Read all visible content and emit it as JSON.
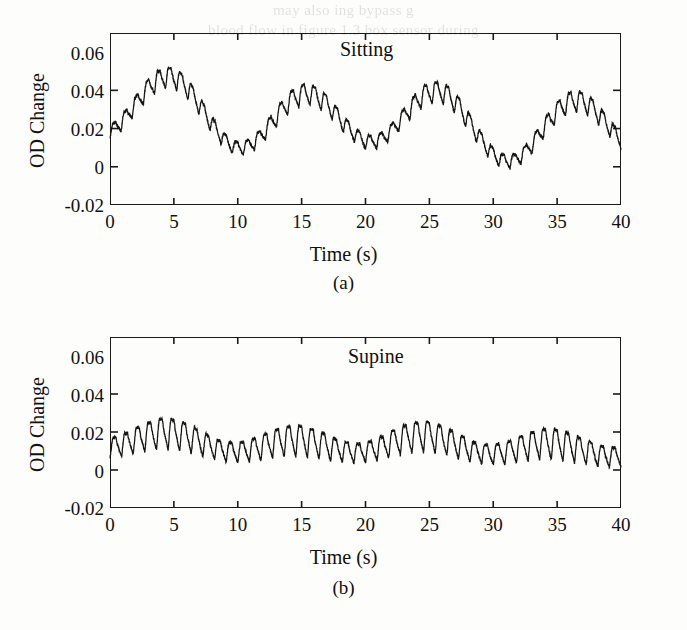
{
  "page": {
    "background_color": "#fdfdfc",
    "ink_color": "#141414",
    "bleedthrough": {
      "line1": "may also ing bypass g",
      "line2": "blood flow in figure 1.3 box sensor during",
      "line3": "use of relating the oximeter the in appl"
    }
  },
  "figure": {
    "panels": [
      {
        "id": "a",
        "caption": "(a)",
        "annotation": "Sitting",
        "chart_data": {
          "type": "line",
          "title": "Sitting",
          "xlabel": "Time (s)",
          "ylabel": "OD Change",
          "xlim": [
            0,
            40
          ],
          "ylim": [
            -0.02,
            0.07
          ],
          "xticks": [
            0,
            5,
            10,
            15,
            20,
            25,
            30,
            35,
            40
          ],
          "xticklabels": [
            "0",
            "5",
            "10",
            "15",
            "20",
            "25",
            "30",
            "35",
            "40"
          ],
          "yticks": [
            -0.02,
            0,
            0.02,
            0.04,
            0.06
          ],
          "yticklabels": [
            "-0.02",
            "0",
            "0.02",
            "0.04",
            "0.06"
          ],
          "grid": false,
          "legend": "none",
          "series": [
            {
              "name": "OD Change (sitting)",
              "description": "Cardiac pulse oscillation near 1.15 Hz riding on a large respiratory/Mayer-wave baseline modulation near 0.095 Hz",
              "pulse_frequency_hz": 1.15,
              "pulse_amplitude": 0.009,
              "baseline_mean": 0.029,
              "baseline_modulation_amplitude": 0.0145,
              "baseline_modulation_frequency_hz": 0.095,
              "baseline_secondary_amplitude": 0.004,
              "baseline_secondary_frequency_hz": 0.052,
              "trend_slope_per_second": -0.00028,
              "envelope_peaks_time_s": [
                2.5,
                13.0,
                22.0,
                31.0
              ],
              "envelope_peaks_value": [
                0.066,
                0.065,
                0.055,
                0.057
              ],
              "envelope_troughs_time_s": [
                8.5,
                18.0,
                27.0,
                37.5
              ],
              "envelope_troughs_value": [
                0.003,
                0.006,
                0.01,
                -0.012
              ],
              "y_min_observed": -0.015,
              "y_max_observed": 0.067
            }
          ]
        }
      },
      {
        "id": "b",
        "caption": "(b)",
        "annotation": "Supine",
        "chart_data": {
          "type": "line",
          "title": "Supine",
          "xlabel": "Time (s)",
          "ylabel": "OD Change",
          "xlim": [
            0,
            40
          ],
          "ylim": [
            -0.02,
            0.07
          ],
          "xticks": [
            0,
            5,
            10,
            15,
            20,
            25,
            30,
            35,
            40
          ],
          "xticklabels": [
            "0",
            "5",
            "10",
            "15",
            "20",
            "25",
            "30",
            "35",
            "40"
          ],
          "yticks": [
            -0.02,
            0,
            0.02,
            0.04,
            0.06
          ],
          "yticklabels": [
            "-0.02",
            "0",
            "0.02",
            "0.04",
            "0.06"
          ],
          "grid": false,
          "legend": "none",
          "series": [
            {
              "name": "OD Change (supine)",
              "description": "Cardiac pulse oscillation near 1.1 Hz with only weak baseline modulation; far smaller respiratory sway than sitting",
              "pulse_frequency_hz": 1.1,
              "pulse_amplitude": 0.0135,
              "baseline_mean": 0.013,
              "baseline_modulation_amplitude": 0.0035,
              "baseline_modulation_frequency_hz": 0.1,
              "baseline_secondary_amplitude": 0.0015,
              "baseline_secondary_frequency_hz": 0.047,
              "trend_slope_per_second": -8e-05,
              "envelope_peaks_time_s": [
                9.5,
                20.5,
                31.0,
                39.5
              ],
              "envelope_peaks_value": [
                0.035,
                0.033,
                0.027,
                0.024
              ],
              "envelope_troughs_time_s": [
                5.0,
                15.0,
                26.0,
                34.0
              ],
              "envelope_troughs_value": [
                -0.004,
                -0.004,
                -0.006,
                -0.016
              ],
              "y_min_observed": -0.018,
              "y_max_observed": 0.036
            }
          ]
        }
      }
    ]
  }
}
